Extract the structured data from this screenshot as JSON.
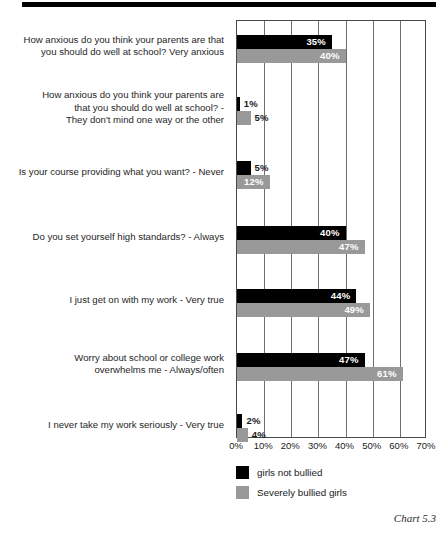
{
  "caption": "Chart 5.3",
  "legend": {
    "items": [
      {
        "label": "girls not bullied",
        "color": "#000000",
        "swatch_name": "legend-swatch-black"
      },
      {
        "label": "Severely bullied girls",
        "color": "#999999",
        "swatch_name": "legend-swatch-gray"
      }
    ]
  },
  "chart_data": {
    "type": "bar",
    "orientation": "horizontal",
    "title": "",
    "subtitle": "",
    "xlabel": "",
    "ylabel": "",
    "xlim": [
      0,
      70
    ],
    "xticks": [
      0,
      10,
      20,
      30,
      40,
      50,
      60,
      70
    ],
    "xtick_labels": [
      "0%",
      "10%",
      "20%",
      "30%",
      "40%",
      "50%",
      "60%",
      "70%"
    ],
    "grid": true,
    "grid_axis": "x",
    "legend_position": "bottom-left",
    "categories": [
      "How anxious do you think your parents are that you should do well at school? Very anxious",
      "How anxious do you think your parents are that you should do well at school? - They don't mind one way or the other",
      "Is your course providing what you want? - Never",
      "Do you set yourself high standards? - Always",
      "I just get on with my work - Very true",
      "Worry about school or college work overwhelms me - Always/often",
      "I never take my work seriously - Very true"
    ],
    "category_label_lines": [
      [
        "How anxious do you think your parents are that",
        "you should do well at school? Very anxious"
      ],
      [
        "How anxious do you think your parents are",
        "that you should do well at school? -",
        "They don't mind one way or the other"
      ],
      [
        "Is your course providing what you want? - Never"
      ],
      [
        "Do you set yourself high standards? - Always"
      ],
      [
        "I just get on with my work - Very true"
      ],
      [
        "Worry about school or college work",
        "overwhelms me - Always/often"
      ],
      [
        "I never take my work seriously - Very true"
      ]
    ],
    "series": [
      {
        "name": "girls not bullied",
        "color": "#000000",
        "values": [
          35,
          1,
          5,
          40,
          44,
          47,
          2
        ],
        "value_labels": [
          "35%",
          "1%",
          "5%",
          "40%",
          "44%",
          "47%",
          "2%"
        ]
      },
      {
        "name": "Severely bullied girls",
        "color": "#999999",
        "values": [
          40,
          5,
          12,
          47,
          49,
          61,
          4
        ],
        "value_labels": [
          "40%",
          "5%",
          "12%",
          "47%",
          "49%",
          "61%",
          "4%"
        ]
      }
    ]
  }
}
